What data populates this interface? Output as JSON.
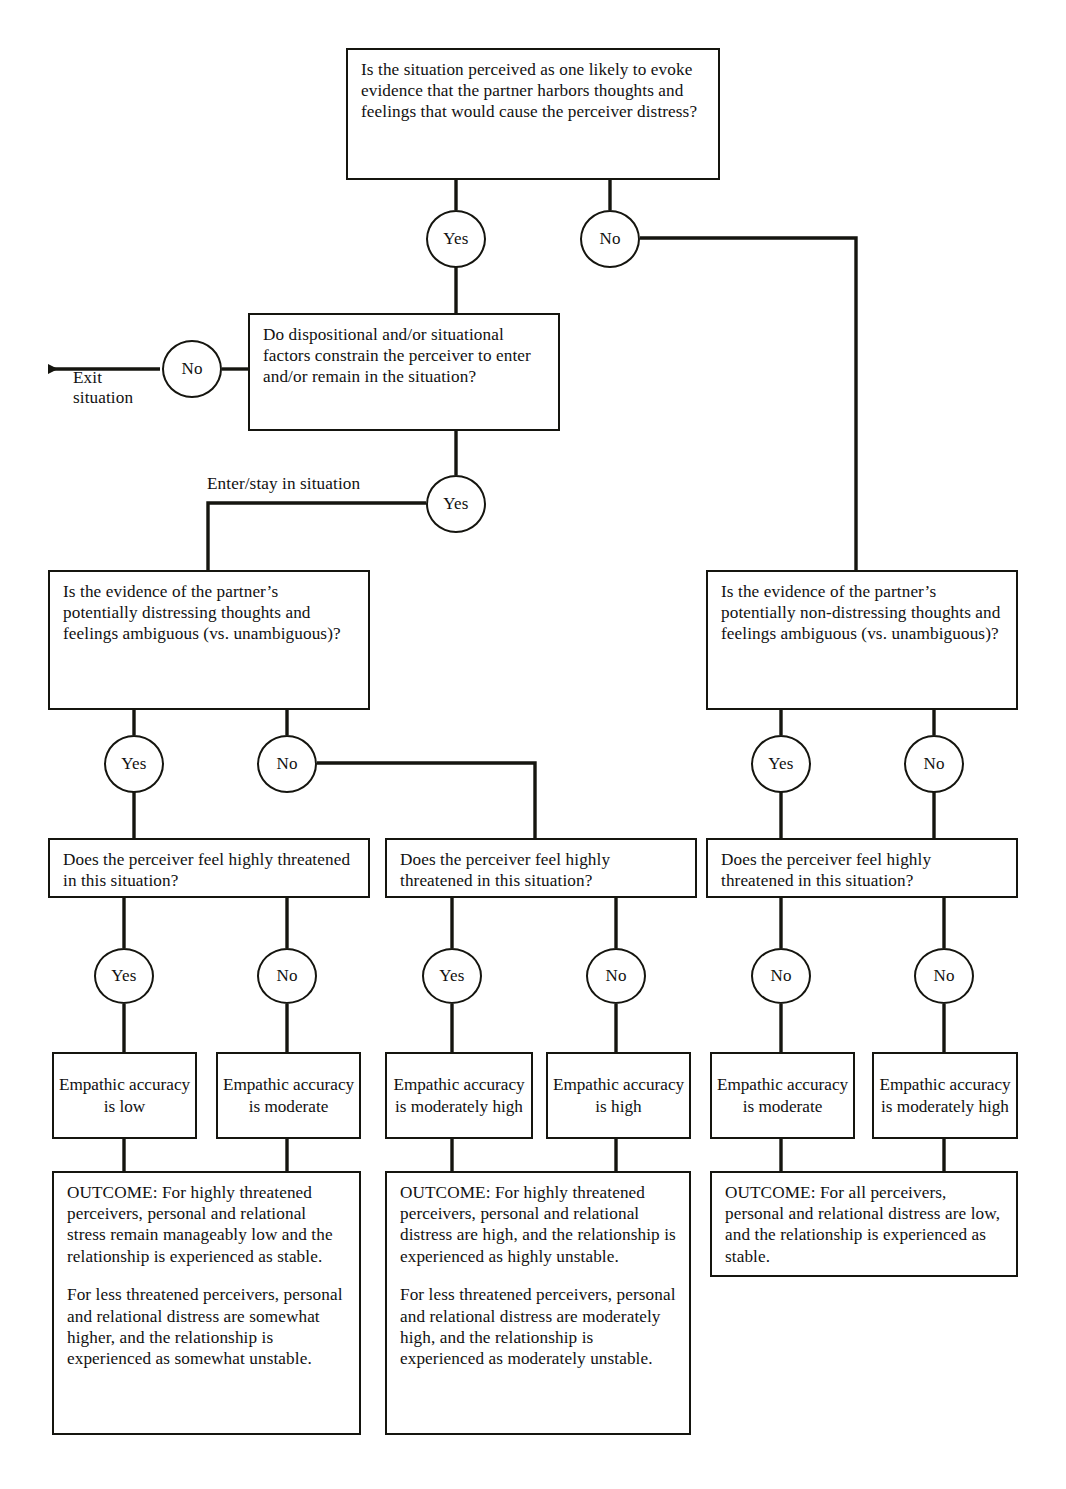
{
  "diagram": {
    "ink_color": "#15150f",
    "background_color": "#ffffff"
  },
  "decisions": {
    "q1_situation_perceived": "Is the situation perceived as one likely to evoke evidence that the partner harbors thoughts and feelings that would cause the perceiver distress?",
    "q2_constraints": "Do dispositional and/or situational factors constrain the perceiver to enter and/or remain in the situation?",
    "q3_left_ambiguous_distressing": "Is the evidence of the partner’s potentially distressing thoughts and feelings ambiguous (vs. unambiguous)?",
    "q3_right_ambiguous_nondistressing": "Is the evidence of the partner’s potentially non-distressing thoughts and feelings ambiguous (vs. unambiguous)?",
    "q4_threatened_left": "Does the perceiver feel highly threatened in this situation?",
    "q4_threatened_middle": "Does the perceiver feel highly threatened in this situation?",
    "q4_threatened_right": "Does the perceiver feel highly threatened in this situation?"
  },
  "nodes": {
    "n1_yes": "Yes",
    "n1_no": "No",
    "n2_no": "No",
    "n2_yes": "Yes",
    "n3_left_yes": "Yes",
    "n3_left_no": "No",
    "n3_right_yes": "Yes",
    "n3_right_no": "No",
    "n4_a_yes": "Yes",
    "n4_b_no": "No",
    "n4_c_yes": "Yes",
    "n4_d_no": "No",
    "n4_e_no": "No",
    "n4_f_no": "No"
  },
  "edge_labels": {
    "exit_situation": "Exit\nsituation",
    "exit_line_1": "Exit",
    "exit_line_2": "situation",
    "enter_stay": "Enter/stay in situation"
  },
  "accuracy": {
    "a1": "Empathic accuracy is low",
    "a2": "Empathic accuracy is moderate",
    "a3": "Empathic accuracy is moderately high",
    "a4": "Empathic accuracy is high",
    "a5": "Empathic accuracy is moderate",
    "a6": "Empathic accuracy is moderately high"
  },
  "outcomes": {
    "left": {
      "p1": "OUTCOME: For highly threatened perceivers, personal and relational stress remain manageably low and the relationship is experienced as stable.",
      "p2": "For less threatened perceivers, personal and relational distress are somewhat higher, and the relationship is experienced as somewhat unstable."
    },
    "middle": {
      "p1": "OUTCOME: For highly threatened perceivers, personal and relational distress are high, and the relationship is experienced as highly unstable.",
      "p2": "For less threatened perceivers, personal and relational distress are moderately high, and the relationship is experienced as moderately unstable."
    },
    "right": {
      "p1": "OUTCOME: For all perceivers, personal and relational distress are low, and the relationship is experienced as stable."
    }
  }
}
